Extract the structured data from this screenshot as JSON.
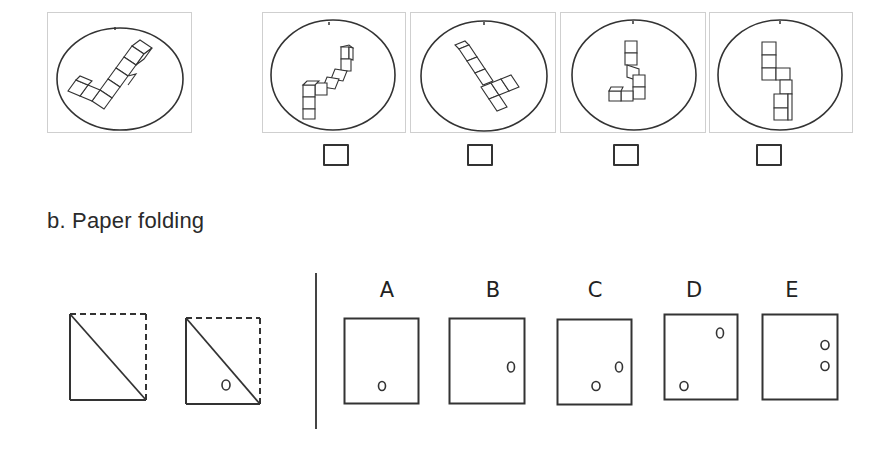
{
  "mental_rotation": {
    "reference": {
      "label": "reference-figure"
    },
    "options": [
      {
        "id": "option-1",
        "checked": false
      },
      {
        "id": "option-2",
        "checked": false
      },
      {
        "id": "option-3",
        "checked": false
      },
      {
        "id": "option-4",
        "checked": false
      }
    ]
  },
  "paper_folding": {
    "title": "b. Paper folding",
    "steps": [
      {
        "id": "fold-step-1",
        "holes": []
      },
      {
        "id": "fold-step-2",
        "holes": [
          {
            "x": 38,
            "y": 67
          }
        ]
      }
    ],
    "options": [
      {
        "label": "A",
        "holes": [
          {
            "x": 38,
            "y": 68
          }
        ]
      },
      {
        "label": "B",
        "holes": [
          {
            "x": 62,
            "y": 49
          }
        ]
      },
      {
        "label": "C",
        "holes": [
          {
            "x": 39,
            "y": 67
          },
          {
            "x": 62,
            "y": 48
          }
        ]
      },
      {
        "label": "D",
        "holes": [
          {
            "x": 20,
            "y": 72
          },
          {
            "x": 56,
            "y": 19
          }
        ]
      },
      {
        "label": "E",
        "holes": [
          {
            "x": 63,
            "y": 31
          },
          {
            "x": 63,
            "y": 52
          }
        ]
      }
    ]
  },
  "colors": {
    "line": "#333333",
    "panel_border": "#cfcfcf"
  }
}
